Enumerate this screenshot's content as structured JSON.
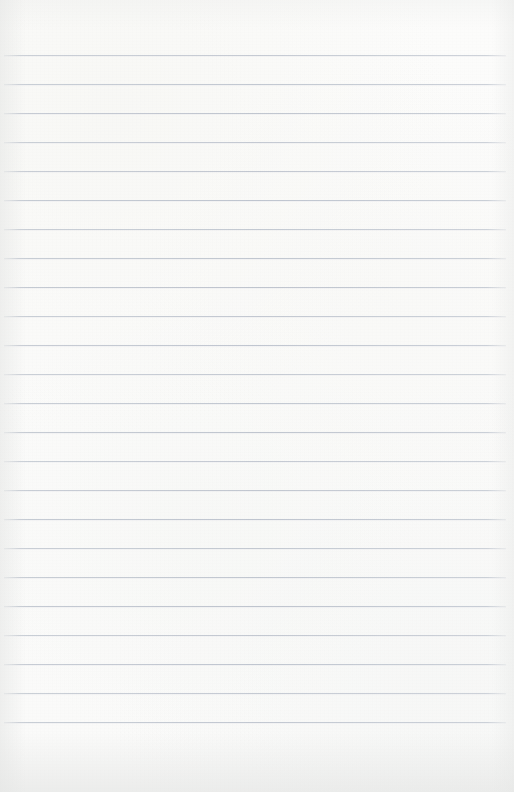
{
  "document": {
    "kind": "ruled-notebook-paper",
    "title": "Blank ruled notebook page",
    "width": 514,
    "height": 792,
    "text_content": "",
    "handwriting_present": false,
    "printed_text_present": false
  },
  "paper": {
    "background_color": "#fbfbfa",
    "edge_shadow_color": "#e4e5e4",
    "texture": "faint scan grain with soft corner vignetting"
  },
  "ruling": {
    "line_color": "#c9ced6",
    "line_thickness_px": 1,
    "line_spacing_px": 29,
    "first_line_y": 55,
    "last_line_y": 748,
    "line_count": 25,
    "line_start_x": 4,
    "line_end_x": 506,
    "top_margin_px": 55,
    "bottom_margin_px": 44,
    "vertical_margin_rule": false,
    "style": "wide-ruled horizontal lines only"
  }
}
